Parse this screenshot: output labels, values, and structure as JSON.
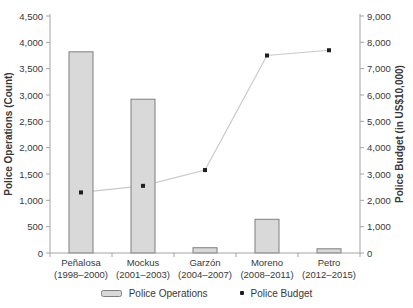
{
  "chart_data": {
    "type": "bar+line",
    "title": "",
    "categories": [
      {
        "name": "Peñalosa",
        "years": "(1998–2000)"
      },
      {
        "name": "Mockus",
        "years": "(2001–2003)"
      },
      {
        "name": "Garzón",
        "years": "(2004–2007)"
      },
      {
        "name": "Moreno",
        "years": "(2008–2011)"
      },
      {
        "name": "Petro",
        "years": "(2012–2015)"
      }
    ],
    "series": [
      {
        "name": "Police Operations",
        "type": "bar",
        "axis": "left",
        "values": [
          3820,
          2920,
          100,
          640,
          80
        ]
      },
      {
        "name": "Police Budget",
        "type": "line",
        "axis": "right",
        "values": [
          2300,
          2550,
          3150,
          7500,
          7700
        ]
      }
    ],
    "left_axis": {
      "title": "Police Operations (Count)",
      "min": 0,
      "max": 4500,
      "step": 500
    },
    "right_axis": {
      "title": "Police Budget (in US$10,000)",
      "min": 0,
      "max": 9000,
      "step": 1000
    },
    "legend_position": "bottom",
    "grid": false
  },
  "colors": {
    "bar_fill": "#d9d9d9",
    "bar_border": "#7f7f7f",
    "line": "#c9c9c9",
    "marker": "#1f1f1f",
    "axis": "#a3a3a3",
    "text": "#383838"
  }
}
